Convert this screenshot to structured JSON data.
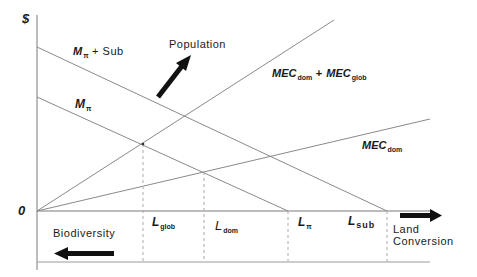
{
  "diagram": {
    "axes": {
      "y_label": "$",
      "origin_label": "0",
      "x_right_label_line1": "Land",
      "x_right_label_line2": "Conversion",
      "x_left_label": "Biodiversity"
    },
    "curves": [
      {
        "id": "m_pi_sub",
        "label_main": "M",
        "label_sub": "π",
        "label_suffix": " + Sub"
      },
      {
        "id": "m_pi",
        "label_main": "M",
        "label_sub": "π"
      },
      {
        "id": "mec_total",
        "label_a": "MEC",
        "label_a_sub": "dom",
        "label_plus": " + ",
        "label_b": "MEC",
        "label_b_sub": "glob"
      },
      {
        "id": "mec_dom",
        "label_main": "MEC",
        "label_sub": "dom"
      }
    ],
    "shift_annotation": "Population",
    "x_markers": [
      {
        "id": "l_glob",
        "main": "L",
        "sub": "glob"
      },
      {
        "id": "l_dom",
        "main": "L",
        "sub": "dom"
      },
      {
        "id": "l_pi",
        "main": "L",
        "sub": "π"
      },
      {
        "id": "l_sub",
        "main": "L",
        "sub": "sub"
      }
    ],
    "colors": {
      "line": "#8a8a8a",
      "axis": "#7a7a7a",
      "arrow": "#111111",
      "text": "#1a1a1a"
    }
  }
}
